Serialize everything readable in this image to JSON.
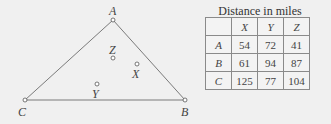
{
  "diagram": {
    "points": {
      "A": {
        "label": "A",
        "x": 113,
        "y": 20
      },
      "B": {
        "label": "B",
        "x": 185,
        "y": 100
      },
      "C": {
        "label": "C",
        "x": 25,
        "y": 100
      },
      "X": {
        "label": "X",
        "x": 137,
        "y": 64
      },
      "Y": {
        "label": "Y",
        "x": 97,
        "y": 84
      },
      "Z": {
        "label": "Z",
        "x": 113,
        "y": 58
      }
    },
    "line_color": "#777777"
  },
  "table": {
    "title": "Distance in miles",
    "columns": [
      "",
      "X",
      "Y",
      "Z"
    ],
    "rows": [
      {
        "label": "A",
        "values": [
          "54",
          "72",
          "41"
        ]
      },
      {
        "label": "B",
        "values": [
          "61",
          "94",
          "87"
        ]
      },
      {
        "label": "C",
        "values": [
          "125",
          "77",
          "104"
        ]
      }
    ]
  }
}
